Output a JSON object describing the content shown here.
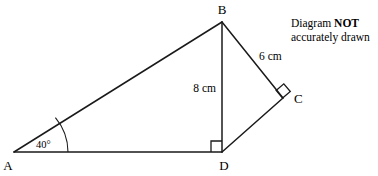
{
  "figure": {
    "stroke_color": "#1a1a1a",
    "background_color": "#ffffff",
    "vertices": {
      "A": {
        "label": "A",
        "x": 14,
        "y": 152
      },
      "B": {
        "label": "B",
        "x": 222,
        "y": 22
      },
      "C": {
        "label": "C",
        "x": 283,
        "y": 98
      },
      "D": {
        "label": "D",
        "x": 222,
        "y": 152
      }
    },
    "segments": [
      {
        "name": "segment-AB",
        "from": "A",
        "to": "B"
      },
      {
        "name": "segment-AD",
        "from": "A",
        "to": "D"
      },
      {
        "name": "segment-BD",
        "from": "B",
        "to": "D"
      },
      {
        "name": "segment-BC",
        "from": "B",
        "to": "C"
      },
      {
        "name": "segment-DC",
        "from": "D",
        "to": "C"
      }
    ],
    "measurements": {
      "bd": "8 cm",
      "bc": "6 cm"
    },
    "angles": {
      "at_a": "40°",
      "at_d": "right angle",
      "at_c": "right angle"
    }
  },
  "note": {
    "line1_prefix": "Diagram ",
    "line1_bold": "NOT",
    "line2": "accurately drawn"
  }
}
